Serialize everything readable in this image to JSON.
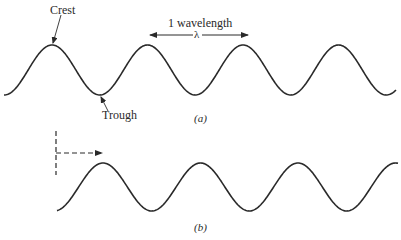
{
  "figure": {
    "panel_a": {
      "caption": "(a)",
      "labels": {
        "crest": "Crest",
        "trough": "Trough",
        "wavelength": "1 wavelength",
        "lambda": "λ"
      },
      "wave": {
        "start_x": 4,
        "end_x": 396,
        "crest_y": 45,
        "trough_y": 95,
        "wavelength_px": 95.5,
        "first_crest_x": 52
      }
    },
    "panel_b": {
      "caption": "(b)",
      "wave": {
        "start_x": 57,
        "end_x": 398,
        "crest_y": 163,
        "trough_y": 211,
        "wavelength_px": 97.5,
        "first_crest_x": 103
      },
      "reference_marker": "dashed vertical line with dashed arrow pointing right (direction of propagation)"
    },
    "colors": {
      "line": "#2a2a2a",
      "background": "#ffffff"
    }
  }
}
